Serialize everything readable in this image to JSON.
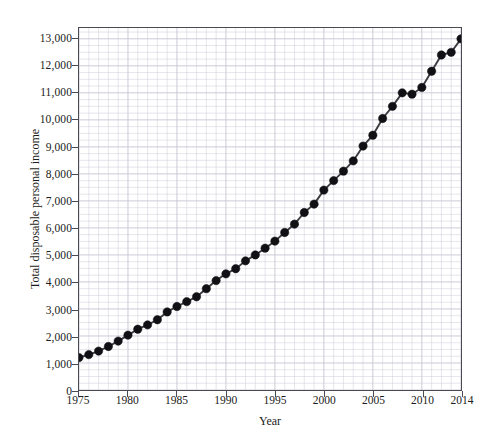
{
  "chart_data": {
    "type": "line",
    "title": "",
    "xlabel": "Year",
    "ylabel": "Total disposable personal income",
    "xlim": [
      1975,
      2014
    ],
    "ylim": [
      0,
      13400
    ],
    "grid": true,
    "legend": false,
    "x_major_ticks": [
      1975,
      1980,
      1985,
      1990,
      1995,
      2000,
      2005,
      2010,
      2014
    ],
    "x_major_tick_labels": [
      "1975",
      "1980",
      "1985",
      "1990",
      "1995",
      "2000",
      "2005",
      "2010",
      "2014"
    ],
    "x_minor_tick_step": 1,
    "y_major_ticks": [
      0,
      1000,
      2000,
      3000,
      4000,
      5000,
      6000,
      7000,
      8000,
      9000,
      10000,
      11000,
      12000,
      13000
    ],
    "y_major_tick_labels": [
      "0",
      "1,000",
      "2,000",
      "3,000",
      "4,000",
      "5,000",
      "6,000",
      "7,000",
      "8,000",
      "9,000",
      "10,000",
      "11,000",
      "12,000",
      "13,000"
    ],
    "y_minor_tick_step": 250,
    "marker": "filled-circle",
    "marker_size": 4.2,
    "line_color": "#3b3b42",
    "marker_color": "#111115",
    "grid_color": "#c8c8d4",
    "axis_color": "#4a4a52",
    "x": [
      1975,
      1976,
      1977,
      1978,
      1979,
      1980,
      1981,
      1982,
      1983,
      1984,
      1985,
      1986,
      1987,
      1988,
      1989,
      1990,
      1991,
      1992,
      1993,
      1994,
      1995,
      1996,
      1997,
      1998,
      1999,
      2000,
      2001,
      2002,
      2003,
      2004,
      2005,
      2006,
      2007,
      2008,
      2009,
      2010,
      2011,
      2012,
      2013,
      2014
    ],
    "values": [
      1200,
      1310,
      1440,
      1610,
      1810,
      2030,
      2250,
      2410,
      2600,
      2890,
      3090,
      3270,
      3450,
      3750,
      4050,
      4300,
      4490,
      4780,
      5000,
      5250,
      5510,
      5830,
      6140,
      6570,
      6880,
      7400,
      7750,
      8100,
      8480,
      9030,
      9430,
      10050,
      10500,
      11000,
      10950,
      11200,
      11800,
      12400,
      12500,
      13000
    ]
  }
}
